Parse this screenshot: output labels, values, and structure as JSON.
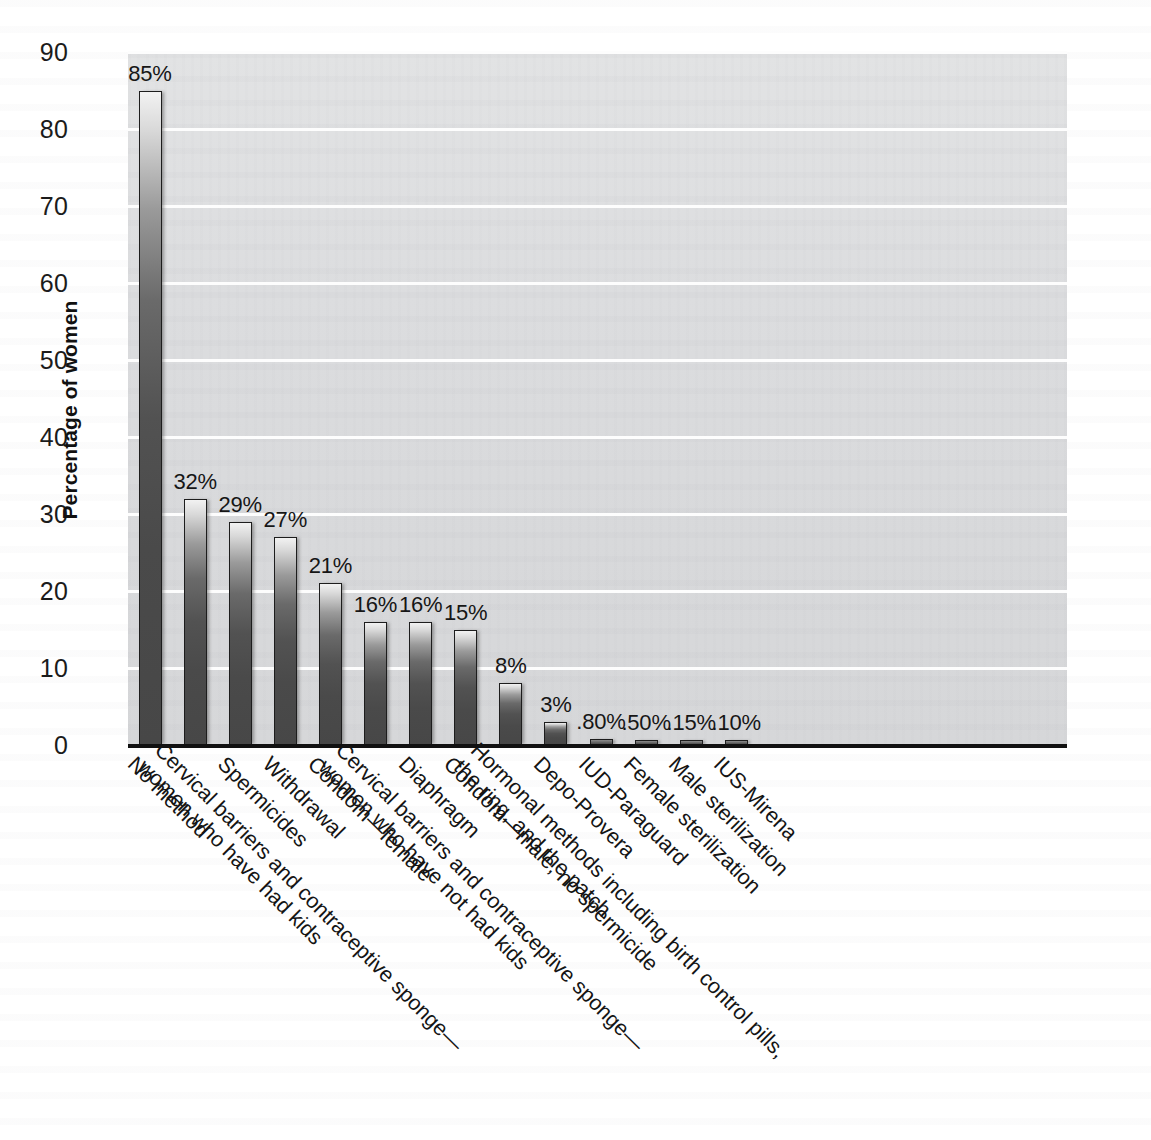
{
  "chart_data": {
    "type": "bar",
    "title": "",
    "xlabel": "",
    "ylabel": "Percentage of women",
    "ylim": [
      0,
      90
    ],
    "yticks": [
      0,
      10,
      20,
      30,
      40,
      50,
      60,
      70,
      80,
      90
    ],
    "ytick_labels": [
      "0",
      "10",
      "20",
      "30",
      "40",
      "50",
      "60",
      "70",
      "80",
      "90"
    ],
    "grid": "horizontal",
    "legend": "none",
    "categories": [
      "No method",
      "Cervical barriers and contraceptive sponge—women who have had kids",
      "Spermicides",
      "Withdrawal",
      "Condom—female",
      "Cervical barriers and contraceptive sponge—women who have not had kids",
      "Diaphragm",
      "Condom—male, no spermicide",
      "Hormonal methods including birth control pills, the ring, and the patch",
      "Depo-Provera",
      "IUD-Paraguard",
      "Female sterilization",
      "Male sterilization",
      "IUS-Mirena"
    ],
    "values": [
      85,
      32,
      29,
      27,
      21,
      16,
      16,
      15,
      8,
      3,
      0.8,
      0.5,
      0.15,
      0.1
    ],
    "data_labels": [
      "85%",
      "32%",
      "29%",
      "27%",
      "21%",
      "16%",
      "16%",
      "15%",
      "8%",
      "3%",
      ".80%",
      ".50%",
      ".15%",
      ".10%"
    ],
    "bars": [
      {
        "label_line1": "No method",
        "label_line2": "",
        "value": 85,
        "data_label": "85%"
      },
      {
        "label_line1": "Cervical barriers and contraceptive sponge—",
        "label_line2": "women who have had kids",
        "value": 32,
        "data_label": "32%"
      },
      {
        "label_line1": "Spermicides",
        "label_line2": "",
        "value": 29,
        "data_label": "29%"
      },
      {
        "label_line1": "Withdrawal",
        "label_line2": "",
        "value": 27,
        "data_label": "27%"
      },
      {
        "label_line1": "Condom—female",
        "label_line2": "",
        "value": 21,
        "data_label": "21%"
      },
      {
        "label_line1": "Cervical barriers and contraceptive sponge—",
        "label_line2": "women who have not had kids",
        "value": 16,
        "data_label": "16%"
      },
      {
        "label_line1": "Diaphragm",
        "label_line2": "",
        "value": 16,
        "data_label": "16%"
      },
      {
        "label_line1": "Condom—male, no spermicide",
        "label_line2": "",
        "value": 15,
        "data_label": "15%"
      },
      {
        "label_line1": "Hormonal methods including birth control pills,",
        "label_line2": "the ring, and the patch",
        "value": 8,
        "data_label": "8%"
      },
      {
        "label_line1": "Depo-Provera",
        "label_line2": "",
        "value": 3,
        "data_label": "3%"
      },
      {
        "label_line1": "IUD-Paraguard",
        "label_line2": "",
        "value": 0.8,
        "data_label": ".80%"
      },
      {
        "label_line1": "Female sterilization",
        "label_line2": "",
        "value": 0.5,
        "data_label": ".50%"
      },
      {
        "label_line1": "Male sterilization",
        "label_line2": "",
        "value": 0.15,
        "data_label": ".15%"
      },
      {
        "label_line1": "IUS-Mirena",
        "label_line2": "",
        "value": 0.1,
        "data_label": ".10%"
      }
    ],
    "colors": {
      "plot_background": "#dcdddf",
      "gridline": "#fdfdfd",
      "axis": "#111111",
      "bar_top": "#f2f2f2",
      "bar_bottom": "#474747",
      "bar_border": "#1d1d1d",
      "text": "#141414",
      "page_background": "#ffffff"
    }
  }
}
